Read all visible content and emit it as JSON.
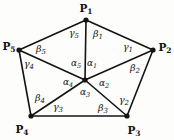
{
  "figure": {
    "kind": "pentagon-triangulation-angle-diagram",
    "background_color": "#fdfdfc",
    "stroke_color": "#141414",
    "canvas": {
      "width": 174,
      "height": 140
    },
    "vertices": [
      {
        "name": "P1",
        "letter": "P",
        "sub": "1",
        "x": 86,
        "y": 20,
        "label_x": 86,
        "label_y": 9
      },
      {
        "name": "P2",
        "letter": "P",
        "sub": "2",
        "x": 153,
        "y": 50,
        "label_x": 165,
        "label_y": 48
      },
      {
        "name": "P3",
        "letter": "P",
        "sub": "3",
        "x": 127,
        "y": 116,
        "label_x": 134,
        "label_y": 131
      },
      {
        "name": "P4",
        "letter": "P",
        "sub": "4",
        "x": 31,
        "y": 116,
        "label_x": 22,
        "label_y": 130
      },
      {
        "name": "P5",
        "letter": "P",
        "sub": "5",
        "x": 19,
        "y": 50,
        "label_x": 9,
        "label_y": 47
      }
    ],
    "center": {
      "name": "center-point",
      "x": 85,
      "y": 80
    },
    "edges": [
      {
        "name": "edge-p1-p2",
        "from": "P1",
        "to": "P2"
      },
      {
        "name": "edge-p2-p3",
        "from": "P2",
        "to": "P3"
      },
      {
        "name": "edge-p3-p4",
        "from": "P3",
        "to": "P4"
      },
      {
        "name": "edge-p4-p5",
        "from": "P4",
        "to": "P5"
      },
      {
        "name": "edge-p5-p1",
        "from": "P5",
        "to": "P1"
      }
    ],
    "spokes": [
      {
        "name": "spoke-center-p1",
        "to": "P1"
      },
      {
        "name": "spoke-center-p2",
        "to": "P2"
      },
      {
        "name": "spoke-center-p3",
        "to": "P3"
      },
      {
        "name": "spoke-center-p4",
        "to": "P4"
      },
      {
        "name": "spoke-center-p5",
        "to": "P5"
      }
    ],
    "center_angles": [
      {
        "name": "alpha-1",
        "greek": "α",
        "sub": "1",
        "x": 92,
        "y": 64
      },
      {
        "name": "alpha-2",
        "greek": "α",
        "sub": "2",
        "x": 104,
        "y": 84
      },
      {
        "name": "alpha-3",
        "greek": "α",
        "sub": "3",
        "x": 85,
        "y": 93
      },
      {
        "name": "alpha-4",
        "greek": "α",
        "sub": "4",
        "x": 68,
        "y": 83
      },
      {
        "name": "alpha-5",
        "greek": "α",
        "sub": "5",
        "x": 76,
        "y": 64
      }
    ],
    "beta_angles": [
      {
        "name": "beta-1",
        "greek": "β",
        "sub": "1",
        "x": 98,
        "y": 35
      },
      {
        "name": "beta-2",
        "greek": "β",
        "sub": "2",
        "x": 135,
        "y": 69
      },
      {
        "name": "beta-3",
        "greek": "β",
        "sub": "3",
        "x": 103,
        "y": 109
      },
      {
        "name": "beta-4",
        "greek": "β",
        "sub": "4",
        "x": 40,
        "y": 99
      },
      {
        "name": "beta-5",
        "greek": "β",
        "sub": "5",
        "x": 41,
        "y": 50
      }
    ],
    "gamma_angles": [
      {
        "name": "gamma-1",
        "greek": "γ",
        "sub": "1",
        "x": 128,
        "y": 48
      },
      {
        "name": "gamma-2",
        "greek": "γ",
        "sub": "2",
        "x": 124,
        "y": 101
      },
      {
        "name": "gamma-3",
        "greek": "γ",
        "sub": "3",
        "x": 58,
        "y": 108
      },
      {
        "name": "gamma-4",
        "greek": "γ",
        "sub": "4",
        "x": 29,
        "y": 65
      },
      {
        "name": "gamma-5",
        "greek": "γ",
        "sub": "5",
        "x": 74,
        "y": 34
      }
    ]
  }
}
